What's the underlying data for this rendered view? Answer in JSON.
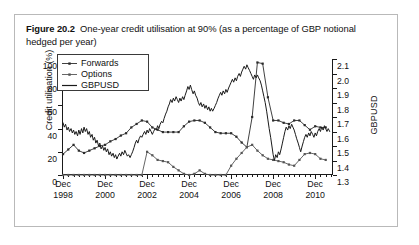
{
  "figure": {
    "number": "Figure 20.2",
    "caption": "One-year credit utilisation at 90% (as a percentage of GBP notional hedged per year)"
  },
  "chart_data": {
    "type": "line",
    "title": "One-year credit utilisation at 90% (as a percentage of GBP notional hedged per year)",
    "xlabel": "",
    "ylabel": "Credit utilisation (%)",
    "y2label": "GBPUSD",
    "ylim": [
      0,
      100
    ],
    "y2lim": [
      1.3,
      2.1
    ],
    "grid": false,
    "legend_position": "top-left",
    "yticks": [
      0,
      20,
      40,
      60,
      80,
      100
    ],
    "y2ticks": [
      1.3,
      1.4,
      1.5,
      1.6,
      1.7,
      1.8,
      1.9,
      2.0,
      2.1
    ],
    "xticklabels": [
      {
        "line1": "Dec",
        "line2": "1998"
      },
      {
        "line1": "Dec",
        "line2": "2000"
      },
      {
        "line1": "Dec",
        "line2": "2002"
      },
      {
        "line1": "Dec",
        "line2": "2004"
      },
      {
        "line1": "Dec",
        "line2": "2006"
      },
      {
        "line1": "Dec",
        "line2": "2008"
      },
      {
        "line1": "Dec",
        "line2": "2010"
      }
    ],
    "xlim_years": [
      1998.95,
      2011.8
    ],
    "series": [
      {
        "name": "Forwards",
        "axis": "left",
        "style": "line-marker",
        "color": "#2b2b2b",
        "x": [
          1999.0,
          1999.25,
          1999.5,
          1999.75,
          2000.0,
          2000.25,
          2000.5,
          2000.75,
          2001.0,
          2001.25,
          2001.5,
          2001.75,
          2002.0,
          2002.25,
          2002.5,
          2002.75,
          2003.0,
          2003.25,
          2003.5,
          2003.75,
          2004.0,
          2004.25,
          2004.5,
          2004.75,
          2005.0,
          2005.25,
          2005.5,
          2005.75,
          2006.0,
          2006.25,
          2006.5,
          2006.75,
          2007.0,
          2007.25,
          2007.5,
          2007.75,
          2008.0,
          2008.25,
          2008.5,
          2008.75,
          2009.0,
          2009.25,
          2009.5,
          2009.75,
          2010.0,
          2010.25,
          2010.5,
          2010.75,
          2011.0,
          2011.25,
          2011.5
        ],
        "y": [
          18,
          22,
          26,
          21,
          19,
          21,
          23,
          25,
          26,
          29,
          31,
          34,
          36,
          41,
          44,
          47,
          46,
          41,
          39,
          37,
          37,
          37,
          37,
          42,
          46,
          47,
          47,
          45,
          41,
          37,
          36,
          36,
          36,
          33,
          28,
          24,
          50,
          97,
          96,
          67,
          47,
          47,
          45,
          44,
          47,
          47,
          43,
          39,
          42,
          41,
          41
        ]
      },
      {
        "name": "Options",
        "axis": "left",
        "style": "line-marker",
        "color": "#555555",
        "x": [
          1999.0,
          1999.25,
          1999.5,
          1999.75,
          2000.0,
          2000.25,
          2000.5,
          2000.75,
          2001.0,
          2001.25,
          2001.5,
          2001.75,
          2002.0,
          2002.25,
          2002.5,
          2002.75,
          2003.0,
          2003.25,
          2003.5,
          2003.75,
          2004.0,
          2004.25,
          2004.5,
          2004.75,
          2005.0,
          2005.25,
          2005.5,
          2005.75,
          2006.0,
          2006.25,
          2006.5,
          2006.75,
          2007.0,
          2007.25,
          2007.5,
          2007.75,
          2008.0,
          2008.25,
          2008.5,
          2008.75,
          2009.0,
          2009.25,
          2009.5,
          2009.75,
          2010.0,
          2010.25,
          2010.5,
          2010.75,
          2011.0,
          2011.25,
          2011.5
        ],
        "y": [
          0,
          0,
          0,
          0,
          0,
          0,
          0,
          0,
          0,
          0,
          0,
          0,
          0,
          0,
          0,
          0,
          20,
          17,
          13,
          12,
          11,
          7,
          4,
          1,
          0,
          1,
          4,
          1,
          0,
          0,
          0,
          0,
          8,
          14,
          19,
          24,
          26,
          21,
          17,
          14,
          13,
          12,
          11,
          9,
          8,
          13,
          18,
          19,
          18,
          14,
          13
        ]
      },
      {
        "name": "GBPUSD",
        "axis": "right",
        "style": "line",
        "color": "#1a1a1a",
        "x": [
          1999.0,
          1999.06,
          1999.12,
          1999.19,
          1999.25,
          1999.31,
          1999.38,
          1999.44,
          1999.5,
          1999.56,
          1999.62,
          1999.69,
          1999.75,
          1999.81,
          1999.88,
          1999.94,
          2000.0,
          2000.06,
          2000.12,
          2000.19,
          2000.25,
          2000.31,
          2000.38,
          2000.44,
          2000.5,
          2000.56,
          2000.62,
          2000.69,
          2000.75,
          2000.81,
          2000.88,
          2000.94,
          2001.0,
          2001.06,
          2001.12,
          2001.19,
          2001.25,
          2001.31,
          2001.38,
          2001.44,
          2001.5,
          2001.56,
          2001.62,
          2001.69,
          2001.75,
          2001.81,
          2001.88,
          2001.94,
          2002.0,
          2002.06,
          2002.12,
          2002.19,
          2002.25,
          2002.31,
          2002.38,
          2002.44,
          2002.5,
          2002.56,
          2002.62,
          2002.69,
          2002.75,
          2002.81,
          2002.88,
          2002.94,
          2003.0,
          2003.06,
          2003.12,
          2003.19,
          2003.25,
          2003.31,
          2003.38,
          2003.44,
          2003.5,
          2003.56,
          2003.62,
          2003.69,
          2003.75,
          2003.81,
          2003.88,
          2003.94,
          2004.0,
          2004.06,
          2004.12,
          2004.19,
          2004.25,
          2004.31,
          2004.38,
          2004.44,
          2004.5,
          2004.56,
          2004.62,
          2004.69,
          2004.75,
          2004.81,
          2004.88,
          2004.94,
          2005.0,
          2005.06,
          2005.12,
          2005.19,
          2005.25,
          2005.31,
          2005.38,
          2005.44,
          2005.5,
          2005.56,
          2005.62,
          2005.69,
          2005.75,
          2005.81,
          2005.88,
          2005.94,
          2006.0,
          2006.06,
          2006.12,
          2006.19,
          2006.25,
          2006.31,
          2006.38,
          2006.44,
          2006.5,
          2006.56,
          2006.62,
          2006.69,
          2006.75,
          2006.81,
          2006.88,
          2006.94,
          2007.0,
          2007.06,
          2007.12,
          2007.19,
          2007.25,
          2007.31,
          2007.38,
          2007.44,
          2007.5,
          2007.56,
          2007.62,
          2007.69,
          2007.75,
          2007.81,
          2007.88,
          2007.94,
          2008.0,
          2008.06,
          2008.12,
          2008.19,
          2008.25,
          2008.31,
          2008.38,
          2008.44,
          2008.5,
          2008.56,
          2008.62,
          2008.69,
          2008.75,
          2008.81,
          2008.88,
          2008.94,
          2009.0,
          2009.06,
          2009.12,
          2009.19,
          2009.25,
          2009.31,
          2009.38,
          2009.44,
          2009.5,
          2009.56,
          2009.62,
          2009.69,
          2009.75,
          2009.81,
          2009.88,
          2009.94,
          2010.0,
          2010.06,
          2010.12,
          2010.19,
          2010.25,
          2010.31,
          2010.38,
          2010.44,
          2010.5,
          2010.56,
          2010.62,
          2010.69,
          2010.75,
          2010.81,
          2010.88,
          2010.94,
          2011.0,
          2011.06,
          2011.12,
          2011.19,
          2011.25,
          2011.31,
          2011.38,
          2011.44,
          2011.5,
          2011.56,
          2011.62,
          2011.69
        ],
        "y": [
          1.66,
          1.63,
          1.65,
          1.61,
          1.63,
          1.6,
          1.62,
          1.59,
          1.61,
          1.58,
          1.6,
          1.57,
          1.61,
          1.58,
          1.62,
          1.59,
          1.63,
          1.6,
          1.62,
          1.58,
          1.6,
          1.56,
          1.58,
          1.54,
          1.56,
          1.52,
          1.54,
          1.5,
          1.52,
          1.48,
          1.5,
          1.47,
          1.49,
          1.46,
          1.48,
          1.44,
          1.46,
          1.43,
          1.45,
          1.42,
          1.44,
          1.41,
          1.43,
          1.45,
          1.43,
          1.46,
          1.44,
          1.47,
          1.45,
          1.43,
          1.44,
          1.42,
          1.44,
          1.46,
          1.49,
          1.52,
          1.54,
          1.52,
          1.55,
          1.57,
          1.56,
          1.58,
          1.6,
          1.58,
          1.61,
          1.59,
          1.62,
          1.6,
          1.58,
          1.6,
          1.62,
          1.61,
          1.64,
          1.62,
          1.65,
          1.67,
          1.66,
          1.69,
          1.72,
          1.74,
          1.77,
          1.79,
          1.82,
          1.8,
          1.83,
          1.81,
          1.84,
          1.82,
          1.8,
          1.83,
          1.81,
          1.84,
          1.82,
          1.85,
          1.88,
          1.91,
          1.89,
          1.92,
          1.89,
          1.86,
          1.88,
          1.85,
          1.83,
          1.8,
          1.78,
          1.8,
          1.77,
          1.79,
          1.76,
          1.78,
          1.75,
          1.77,
          1.74,
          1.76,
          1.74,
          1.76,
          1.78,
          1.8,
          1.83,
          1.85,
          1.87,
          1.85,
          1.88,
          1.86,
          1.89,
          1.87,
          1.9,
          1.92,
          1.94,
          1.96,
          1.94,
          1.97,
          1.95,
          1.98,
          2.0,
          1.98,
          2.01,
          2.03,
          2.05,
          2.03,
          2.06,
          2.04,
          2.02,
          2.0,
          1.98,
          1.96,
          1.99,
          1.97,
          1.99,
          1.97,
          1.95,
          1.92,
          1.88,
          1.84,
          1.8,
          1.74,
          1.68,
          1.62,
          1.56,
          1.5,
          1.44,
          1.4,
          1.44,
          1.42,
          1.46,
          1.44,
          1.48,
          1.52,
          1.56,
          1.6,
          1.63,
          1.61,
          1.64,
          1.62,
          1.65,
          1.63,
          1.61,
          1.58,
          1.55,
          1.52,
          1.49,
          1.46,
          1.5,
          1.53,
          1.56,
          1.58,
          1.56,
          1.59,
          1.57,
          1.6,
          1.58,
          1.56,
          1.59,
          1.57,
          1.6,
          1.62,
          1.6,
          1.63,
          1.61,
          1.64,
          1.62,
          1.6,
          1.62,
          1.6
        ]
      }
    ]
  },
  "legend": {
    "items": [
      {
        "label": "Forwards",
        "key": "line-marker-square"
      },
      {
        "label": "Options",
        "key": "line-marker-diamond"
      },
      {
        "label": "GBPUSD",
        "key": "line-plain"
      }
    ]
  }
}
